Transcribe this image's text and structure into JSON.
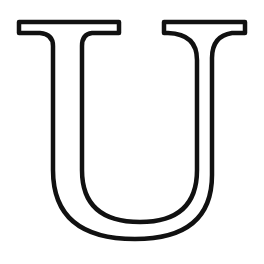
{
  "glyph": {
    "letter": "U",
    "style": "outlined serif capital",
    "stroke_color": "#111111",
    "fill_color": "#ffffff",
    "background": "#ffffff"
  }
}
